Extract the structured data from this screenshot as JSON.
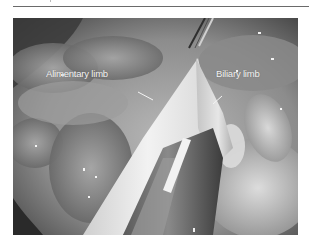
{
  "figure": {
    "type": "laparoscopic-surgical-photograph",
    "grayscale": true,
    "labels": [
      {
        "text": "Alimentary limb"
      },
      {
        "text": "Biliary limb"
      }
    ]
  },
  "colors": {
    "label_text": "#f4f4f4",
    "rule": "#6a6a6a"
  }
}
